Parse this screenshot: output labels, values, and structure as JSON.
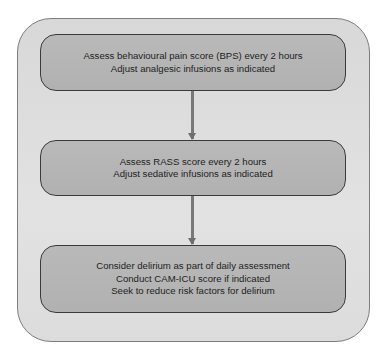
{
  "diagram": {
    "type": "flowchart",
    "direction": "top-to-bottom",
    "colors": {
      "outer_fill": "#dcdcdc",
      "box_fill": "#b5b5b5",
      "box_border": "#3a3a3a",
      "arrow": "#787878",
      "text": "#1e1e1e"
    },
    "steps": [
      {
        "lines": [
          "Assess behavioural pain score (BPS) every 2 hours",
          "Adjust analgesic infusions as indicated"
        ]
      },
      {
        "lines": [
          "Assess RASS score every 2 hours",
          "Adjust sedative infusions as indicated"
        ]
      },
      {
        "lines": [
          "Consider delirium  as part of daily assessment",
          "Conduct CAM-ICU score if indicated",
          "Seek to reduce risk factors for delirium"
        ]
      }
    ],
    "edges": [
      {
        "from": 0,
        "to": 1
      },
      {
        "from": 1,
        "to": 2
      }
    ]
  }
}
